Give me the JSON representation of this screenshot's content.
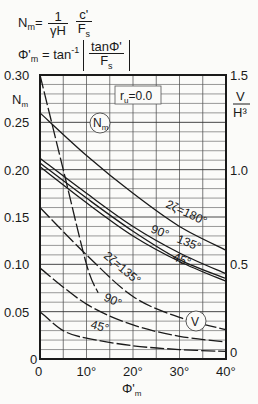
{
  "formulas": {
    "nm_lhs": "N",
    "nm_lhs_sub": "m",
    "nm_eq": "=",
    "nm_frac1_num": "1",
    "nm_frac1_den": "γH",
    "nm_frac2_num": "c'",
    "nm_frac2_den": "F",
    "nm_frac2_den_sub": "s",
    "phi_lhs": "Φ'",
    "phi_lhs_sub": "m",
    "phi_eq": "= tan",
    "phi_exp": "-1",
    "phi_frac_num": "tanΦ'",
    "phi_frac_den": "F",
    "phi_frac_den_sub": "s"
  },
  "chart_data": {
    "type": "line",
    "title": "",
    "xlabel": "Φ'm",
    "ylabel_left": "Nm",
    "ylabel_right": "V/H³",
    "xlim": [
      0,
      40
    ],
    "ylim_left": [
      0,
      0.3
    ],
    "ylim_right": [
      0,
      1.5
    ],
    "x_ticks": [
      "0",
      "10°",
      "20°",
      "30°",
      "40°"
    ],
    "y_ticks_left": [
      "0",
      "0.05",
      "0.10",
      "0.15",
      "0.20",
      "0.25",
      "0.30"
    ],
    "y_ticks_right": [
      "0",
      "0.5",
      "1.0",
      "1.5"
    ],
    "grid": true,
    "grid_x_step": 5,
    "grid_y_step_left": 0.01,
    "annotations": [
      "r_u = 0.0",
      "N_m",
      "V",
      "2ζ=180°",
      "90°",
      "135°",
      "45°",
      "2ζ=135°",
      "90°",
      "45°"
    ],
    "series": [
      {
        "name": "Nm 2ζ=180°",
        "axis": "left",
        "style": "solid",
        "x": [
          0,
          10,
          20,
          30,
          40
        ],
        "values": [
          0.26,
          0.215,
          0.175,
          0.14,
          0.115
        ]
      },
      {
        "name": "Nm 2ζ=135°",
        "axis": "left",
        "style": "solid",
        "x": [
          0,
          10,
          20,
          30,
          40
        ],
        "values": [
          0.212,
          0.175,
          0.14,
          0.112,
          0.09
        ]
      },
      {
        "name": "Nm 2ζ=90°",
        "axis": "left",
        "style": "solid",
        "x": [
          0,
          10,
          20,
          30,
          40
        ],
        "values": [
          0.207,
          0.17,
          0.135,
          0.105,
          0.085
        ]
      },
      {
        "name": "Nm 2ζ=45°",
        "axis": "left",
        "style": "solid",
        "x": [
          0,
          10,
          20,
          30,
          40
        ],
        "values": [
          0.203,
          0.165,
          0.13,
          0.103,
          0.082
        ]
      },
      {
        "name": "V/H³ 2ζ=180°",
        "axis": "right",
        "style": "dashed",
        "x": [
          0,
          5,
          10,
          12.5
        ],
        "values": [
          1.5,
          1.0,
          0.5,
          0.35
        ]
      },
      {
        "name": "V/H³ 2ζ=135°",
        "axis": "right",
        "style": "dashed",
        "x": [
          0,
          10,
          20,
          30,
          40
        ],
        "values": [
          0.8,
          0.55,
          0.33,
          0.22,
          0.155
        ]
      },
      {
        "name": "V/H³ 2ζ=90°",
        "axis": "right",
        "style": "dashed",
        "x": [
          0,
          10,
          20,
          30,
          40
        ],
        "values": [
          0.48,
          0.29,
          0.18,
          0.12,
          0.09
        ]
      },
      {
        "name": "V/H³ 2ζ=45°",
        "axis": "right",
        "style": "dashed",
        "x": [
          0,
          5,
          10,
          20,
          30,
          40
        ],
        "values": [
          0.25,
          0.15,
          0.11,
          0.07,
          0.05,
          0.04
        ]
      }
    ]
  },
  "labels": {
    "ru": "r",
    "ru_sub": "u",
    "ru_val": "=0.0",
    "nm_circle": "N",
    "nm_circle_sub": "m",
    "v_circle": "V",
    "right_axis_num": "V",
    "right_axis_den": "H³",
    "left_axis": "N",
    "left_axis_sub": "m",
    "xlabel": "Φ'",
    "xlabel_sub": "m",
    "nm180": "2ζ=180°",
    "nm90": "90°",
    "nm135": "135°",
    "nm45": "45°",
    "v135": "2ζ=135°",
    "v90": "90°",
    "v45": "45°"
  }
}
